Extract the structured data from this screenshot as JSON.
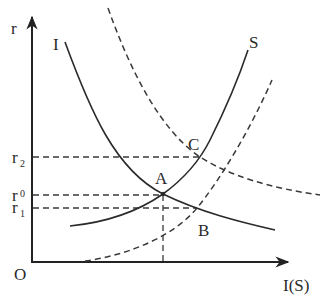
{
  "diagram": {
    "axes": {
      "y_label": "r",
      "x_label": "I(S)",
      "origin_label": "O"
    },
    "y_ticks": [
      {
        "id": "r2",
        "base": "r",
        "sub": "2"
      },
      {
        "id": "r0",
        "base": "r",
        "sub": "0"
      },
      {
        "id": "r1",
        "base": "r",
        "sub": "1"
      }
    ],
    "curves": [
      {
        "id": "I",
        "label": "I",
        "style": "solid",
        "description": "investment curve, downward sloping"
      },
      {
        "id": "S",
        "label": "S",
        "style": "solid",
        "description": "saving curve, upward sloping"
      },
      {
        "id": "I_shifted",
        "label": "",
        "style": "dashed",
        "description": "shifted investment curve (rightward)"
      },
      {
        "id": "S_shifted",
        "label": "",
        "style": "dashed",
        "description": "shifted saving curve (rightward)"
      }
    ],
    "points": [
      {
        "id": "A",
        "label": "A",
        "description": "intersection of I and S at r0"
      },
      {
        "id": "B",
        "label": "B",
        "description": "intersection of I and shifted S at r1"
      },
      {
        "id": "C",
        "label": "C",
        "description": "intersection of shifted I and S at r2"
      }
    ],
    "colors": {
      "line": "#2a2a2a",
      "background": "#ffffff"
    }
  }
}
